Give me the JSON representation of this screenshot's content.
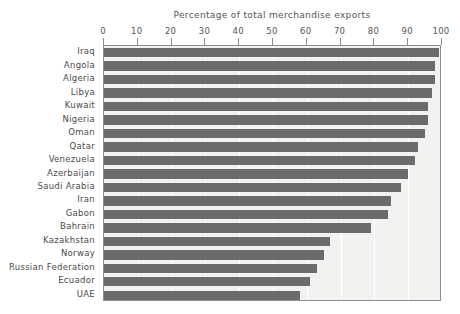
{
  "chart_data": {
    "type": "bar",
    "orientation": "horizontal",
    "title": "Percentage of total merchandise exports",
    "xlabel": "",
    "ylabel": "",
    "xlim": [
      0,
      100
    ],
    "xticks": [
      0,
      10,
      20,
      30,
      40,
      50,
      60,
      70,
      80,
      90,
      100
    ],
    "xtick_labels": [
      "0",
      "10",
      "20",
      "30",
      "40",
      "50",
      "60",
      "70",
      "80",
      "90",
      "100"
    ],
    "grid": true,
    "grid_axis": "x",
    "legend": false,
    "categories": [
      "Iraq",
      "Angola",
      "Algeria",
      "Libya",
      "Kuwait",
      "Nigeria",
      "Oman",
      "Qatar",
      "Venezuela",
      "Azerbaijan",
      "Saudi Arabia",
      "Iran",
      "Gabon",
      "Bahrain",
      "Kazakhstan",
      "Norway",
      "Russian Federation",
      "Ecuador",
      "UAE"
    ],
    "values": [
      99,
      98,
      98,
      97,
      96,
      96,
      95,
      93,
      92,
      90,
      88,
      85,
      84,
      79,
      67,
      65,
      63,
      61,
      58
    ]
  },
  "colors": {
    "bar_fill": "#6b6b6b",
    "plot_background": "#f2f2f0",
    "page_background": "#ffffff",
    "gridline": "#ffffff",
    "frame": "#8d8d8d",
    "text": "#4a4a4a",
    "title_text": "#555555"
  }
}
